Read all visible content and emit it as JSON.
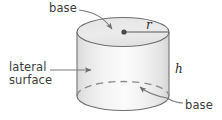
{
  "figure": {
    "shape": "cylinder",
    "labels": {
      "base_top": "base",
      "base_bottom": "base",
      "lateral_surface": "lateral\nsurface",
      "radius_symbol": "r",
      "height_symbol": "h"
    },
    "icons": {
      "center_point": "center-dot-icon",
      "hidden_edge": "dashed-ellipse-icon"
    },
    "colors": {
      "outline": "#6e6e6e",
      "fill_light": "#fbfbfb",
      "fill_mid": "#e9e9e9",
      "fill_edge": "#d6d6d6",
      "top_face": "#eaeaea",
      "text": "#3b3b3b",
      "leader": "#7a7a7a",
      "background": "#ffffff"
    },
    "geometry": {
      "cylinder_left_x": 77,
      "cylinder_right_x": 169,
      "top_center_y": 32,
      "bottom_center_y": 96,
      "radius_x": 46,
      "radius_y": 14.5,
      "center_dot": [
        124,
        32
      ]
    }
  }
}
